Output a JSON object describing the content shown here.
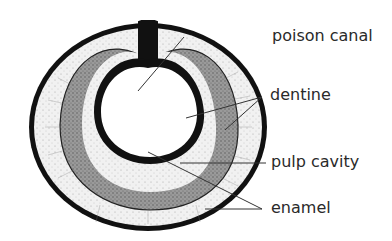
{
  "diagram": {
    "labels": {
      "poison_canal": "poison canal",
      "dentine": "dentine",
      "pulp_cavity": "pulp cavity",
      "enamel": "enamel"
    },
    "colors": {
      "background": "#ffffff",
      "outline": "#111111",
      "dentine_fill": "#eeeeee",
      "pulp_fill": "#8a8a8a",
      "leader_line": "#333333",
      "label_text": "#2a2a2a"
    }
  }
}
